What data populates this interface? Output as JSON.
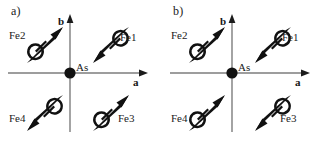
{
  "figure": {
    "type": "magnetic-structure-diagram",
    "width": 324,
    "height": 141,
    "background_color": "#ffffff",
    "line_color": "#7d7d7d",
    "arrow_color": "#111111",
    "text_color": "#1a1a1a"
  },
  "panels": [
    {
      "id": "a",
      "label": "a)",
      "axes": {
        "horizontal_label": "a",
        "vertical_label": "b",
        "origin_label": "As",
        "origin_marker": "filled-circle"
      },
      "spins": [
        {
          "site": "Fe2",
          "quadrant": "top-left",
          "direction": "up-right",
          "label": "Fe2"
        },
        {
          "site": "Fe1",
          "quadrant": "top-right",
          "direction": "down-left",
          "label": "Fe1"
        },
        {
          "site": "Fe4",
          "quadrant": "bottom-left",
          "direction": "down-left",
          "label": "Fe4"
        },
        {
          "site": "Fe3",
          "quadrant": "bottom-right",
          "direction": "up-right",
          "label": "Fe3"
        }
      ]
    },
    {
      "id": "b",
      "label": "b)",
      "axes": {
        "horizontal_label": "a",
        "vertical_label": "b",
        "origin_label": "As",
        "origin_marker": "filled-circle"
      },
      "spins": [
        {
          "site": "Fe2",
          "quadrant": "top-left",
          "direction": "up-right",
          "label": "Fe2"
        },
        {
          "site": "Fe1",
          "quadrant": "top-right",
          "direction": "down-left",
          "label": "Fe1"
        },
        {
          "site": "Fe4",
          "quadrant": "bottom-left",
          "direction": "up-right",
          "label": "Fe4"
        },
        {
          "site": "Fe3",
          "quadrant": "bottom-right",
          "direction": "down-left",
          "label": "Fe3"
        }
      ]
    }
  ],
  "icons": {
    "spin-arrow": "spear-arrow-with-loop",
    "axis-arrow": "solid-triangle-head",
    "origin-dot": "filled-circle"
  }
}
